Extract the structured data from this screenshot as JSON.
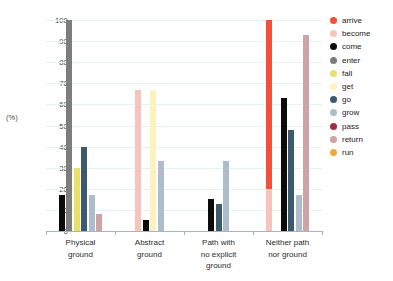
{
  "chart_data": {
    "type": "bar",
    "title": "",
    "subtitle": "",
    "xlabel": "",
    "ylabel": "(%)",
    "ylim": [
      0,
      100
    ],
    "yticks": [
      0,
      10,
      20,
      30,
      40,
      50,
      60,
      70,
      80,
      90,
      100
    ],
    "grid": true,
    "legend_position": "right",
    "categories": [
      "Physical ground",
      "Abstract ground",
      "Path with no explicit ground",
      "Neither path nor ground"
    ],
    "category_lines": [
      [
        "Physical",
        "ground"
      ],
      [
        "Abstract",
        "ground"
      ],
      [
        "Path with",
        "no explicit",
        "ground"
      ],
      [
        "Neither path",
        "nor ground"
      ]
    ],
    "series": [
      {
        "name": "arrive",
        "color": "#f2503c",
        "values": [
          0,
          0,
          0,
          100
        ]
      },
      {
        "name": "become",
        "color": "#f7c4bd",
        "values": [
          0,
          67,
          0,
          20
        ]
      },
      {
        "name": "come",
        "color": "#0b0b0b",
        "values": [
          17,
          5,
          15,
          63
        ]
      },
      {
        "name": "enter",
        "color": "#7d7d7d",
        "values": [
          100,
          0,
          0,
          0
        ]
      },
      {
        "name": "fall",
        "color": "#e8e06b",
        "values": [
          30,
          0,
          0,
          0
        ]
      },
      {
        "name": "get",
        "color": "#faf3c0",
        "values": [
          0,
          67,
          0,
          0
        ]
      },
      {
        "name": "go",
        "color": "#3c5a6e",
        "values": [
          40,
          0,
          13,
          48
        ]
      },
      {
        "name": "grow",
        "color": "#aebdc9",
        "values": [
          17,
          33,
          33,
          17
        ]
      },
      {
        "name": "pass",
        "color": "#9e2f46",
        "values": [
          0,
          0,
          0,
          0
        ]
      },
      {
        "name": "return",
        "color": "#cfa2a6",
        "values": [
          8,
          0,
          0,
          93
        ]
      },
      {
        "name": "run",
        "color": "#f2a93b",
        "values": [
          0,
          0,
          0,
          0
        ]
      }
    ]
  },
  "legend": {
    "items": [
      {
        "label": "arrive",
        "color": "#f2503c"
      },
      {
        "label": "become",
        "color": "#f7c4bd"
      },
      {
        "label": "come",
        "color": "#0b0b0b"
      },
      {
        "label": "enter",
        "color": "#7d7d7d"
      },
      {
        "label": "fall",
        "color": "#e8e06b"
      },
      {
        "label": "get",
        "color": "#faf3c0"
      },
      {
        "label": "go",
        "color": "#3c5a6e"
      },
      {
        "label": "grow",
        "color": "#aebdc9"
      },
      {
        "label": "pass",
        "color": "#9e2f46"
      },
      {
        "label": "return",
        "color": "#cfa2a6"
      },
      {
        "label": "run",
        "color": "#f2a93b"
      }
    ]
  },
  "axis": {
    "y_title": "(%)",
    "y_tick_labels": [
      "0",
      "10",
      "20",
      "30",
      "40",
      "50",
      "60",
      "70",
      "80",
      "90",
      "100"
    ]
  }
}
